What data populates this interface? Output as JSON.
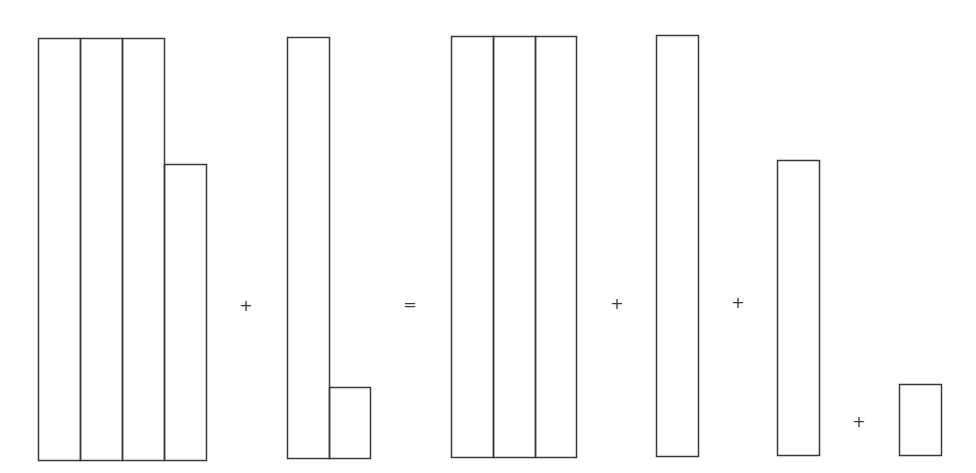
{
  "diagram": {
    "stroke_color": "#3a3a3a",
    "background": "#ffffff",
    "unit_width": 42,
    "groups": [
      {
        "id": "term-1",
        "label": "three tall strips plus a shorter strip",
        "rects": [
          {
            "x": 38,
            "y": 38,
            "w": 42,
            "h": 422
          },
          {
            "x": 80,
            "y": 38,
            "w": 42,
            "h": 422
          },
          {
            "x": 122,
            "y": 38,
            "w": 42,
            "h": 422
          },
          {
            "x": 164,
            "y": 164,
            "w": 42,
            "h": 296
          }
        ]
      },
      {
        "id": "term-2",
        "label": "one tall strip plus a small box",
        "rects": [
          {
            "x": 287,
            "y": 37,
            "w": 42,
            "h": 421
          },
          {
            "x": 329,
            "y": 387,
            "w": 41,
            "h": 71
          }
        ]
      },
      {
        "id": "result-1",
        "label": "three tall strips",
        "rects": [
          {
            "x": 451,
            "y": 36,
            "w": 42,
            "h": 421
          },
          {
            "x": 493,
            "y": 36,
            "w": 42,
            "h": 421
          },
          {
            "x": 535,
            "y": 36,
            "w": 41,
            "h": 421
          }
        ]
      },
      {
        "id": "result-2",
        "label": "one tall strip",
        "rects": [
          {
            "x": 656,
            "y": 35,
            "w": 42,
            "h": 421
          }
        ]
      },
      {
        "id": "result-3",
        "label": "one medium strip",
        "rects": [
          {
            "x": 777,
            "y": 160,
            "w": 42,
            "h": 295
          }
        ]
      },
      {
        "id": "result-4",
        "label": "one small box",
        "rects": [
          {
            "x": 899,
            "y": 384,
            "w": 42,
            "h": 71
          }
        ]
      }
    ],
    "operators": [
      {
        "symbol": "+",
        "x": 246,
        "y": 306
      },
      {
        "symbol": "=",
        "x": 410,
        "y": 305
      },
      {
        "symbol": "+",
        "x": 617,
        "y": 304
      },
      {
        "symbol": "+",
        "x": 738,
        "y": 303
      },
      {
        "symbol": "+",
        "x": 859,
        "y": 422
      }
    ]
  }
}
